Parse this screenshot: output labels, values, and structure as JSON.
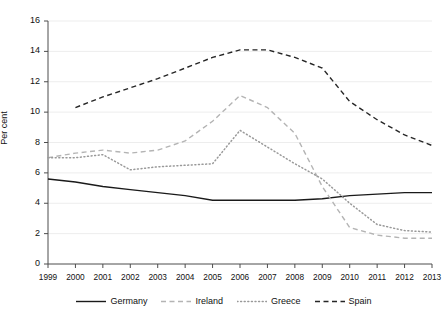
{
  "chart_data": {
    "type": "line",
    "title": "",
    "xlabel": "",
    "ylabel": "Per cent",
    "x": [
      1999,
      2000,
      2001,
      2002,
      2003,
      2004,
      2005,
      2006,
      2007,
      2008,
      2009,
      2010,
      2011,
      2012,
      2013
    ],
    "xtick_labels": [
      "1999",
      "2000",
      "2001",
      "2002",
      "2003",
      "2004",
      "2005",
      "2006",
      "2007",
      "2008",
      "2009",
      "2010",
      "2011",
      "2012",
      "2013"
    ],
    "ytick_labels": [
      "0",
      "2",
      "4",
      "6",
      "8",
      "10",
      "12",
      "14",
      "16"
    ],
    "yticks": [
      0,
      2,
      4,
      6,
      8,
      10,
      12,
      14,
      16
    ],
    "ylim": [
      0,
      16
    ],
    "xlim": [
      1999,
      2013
    ],
    "grid": "horizontal",
    "legend_position": "bottom",
    "series": [
      {
        "name": "Germany",
        "style": "solid",
        "color": "#1a1a1a",
        "x": [
          1999,
          2000,
          2001,
          2002,
          2003,
          2004,
          2005,
          2006,
          2007,
          2008,
          2009,
          2010,
          2011,
          2012,
          2013
        ],
        "values": [
          5.6,
          5.4,
          5.1,
          4.9,
          4.7,
          4.5,
          4.2,
          4.2,
          4.2,
          4.2,
          4.3,
          4.5,
          4.6,
          4.7,
          4.7
        ]
      },
      {
        "name": "Ireland",
        "style": "dashed",
        "color": "#b4b4b4",
        "x": [
          1999,
          2000,
          2001,
          2002,
          2003,
          2004,
          2005,
          2006,
          2007,
          2008,
          2009,
          2010,
          2011,
          2012,
          2013
        ],
        "values": [
          7.0,
          7.3,
          7.5,
          7.3,
          7.5,
          8.1,
          9.4,
          11.1,
          10.3,
          8.6,
          5.1,
          2.4,
          1.9,
          1.7,
          1.7
        ]
      },
      {
        "name": "Greece",
        "style": "dotted",
        "color": "#999999",
        "x": [
          1999,
          2000,
          2001,
          2002,
          2003,
          2004,
          2005,
          2006,
          2007,
          2008,
          2009,
          2010,
          2011,
          2012,
          2013
        ],
        "values": [
          7.0,
          7.0,
          7.2,
          6.2,
          6.4,
          6.5,
          6.6,
          8.8,
          7.7,
          6.6,
          5.6,
          4.0,
          2.6,
          2.2,
          2.1
        ]
      },
      {
        "name": "Spain",
        "style": "dashed",
        "color": "#262626",
        "x": [
          2000,
          2001,
          2002,
          2003,
          2004,
          2005,
          2006,
          2007,
          2008,
          2009,
          2010,
          2011,
          2012,
          2013
        ],
        "values": [
          10.3,
          11.0,
          11.6,
          12.2,
          12.9,
          13.6,
          14.1,
          14.1,
          13.6,
          12.9,
          10.7,
          9.5,
          8.5,
          7.8
        ]
      }
    ]
  }
}
